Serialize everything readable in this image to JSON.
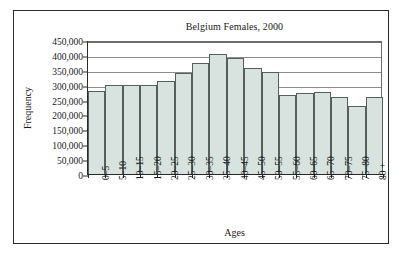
{
  "chart_data": {
    "type": "bar",
    "title": "Belgium Females, 2000",
    "xlabel": "Ages",
    "ylabel": "Frequency",
    "ylim": [
      0,
      450000
    ],
    "ytick_step": 50000,
    "ytick_labels": [
      "450,000",
      "400,000",
      "350,000",
      "300,000",
      "250,000",
      "200,000",
      "150,000",
      "100,000",
      "50,000",
      "0"
    ],
    "ytick_values": [
      450000,
      400000,
      350000,
      300000,
      250000,
      200000,
      150000,
      100000,
      50000,
      0
    ],
    "gridlines": [
      450000,
      400000,
      350000,
      300000
    ],
    "grid": "partial-horizontal",
    "legend": "none",
    "categories": [
      "0–5",
      "5–10",
      "10–15",
      "15–20",
      "20–25",
      "25–30",
      "30–35",
      "35–40",
      "40–45",
      "45–50",
      "50–55",
      "55–60",
      "60–65",
      "65–70",
      "70–75",
      "75–80",
      "80 +"
    ],
    "values": [
      280000,
      300000,
      300000,
      300000,
      312000,
      340000,
      372000,
      402000,
      388000,
      356000,
      341000,
      266000,
      271000,
      277000,
      260000,
      230000,
      257000
    ],
    "bar_fill": "#d8e2de",
    "bar_stroke": "#55605c",
    "gridline_color": "#8d8d8d",
    "axis_color": "#2a2a2a",
    "frame_color": "#2a2a2a"
  }
}
